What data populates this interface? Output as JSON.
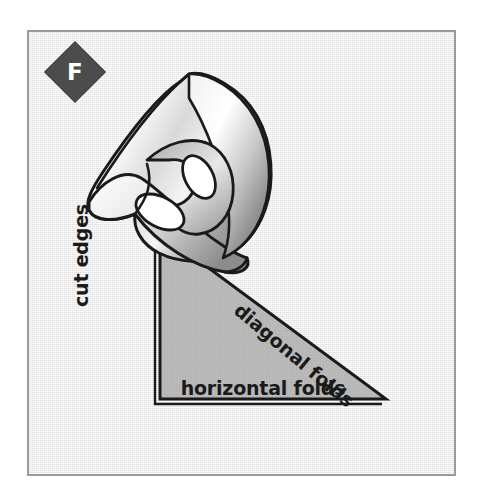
{
  "figure": {
    "panel_letter": "F",
    "panel_letter_name": "panel-label-f",
    "colors": {
      "frame_border": "#9a9a9e",
      "plate_background": "#eeeeee",
      "badge_fill": "#4c4c4c",
      "badge_text": "#ffffff",
      "ink": "#1a1a1a",
      "triangle_fill": "#b8b8b8",
      "paper_highlight": "#ffffff",
      "paper_shade": "#7d7d7d"
    },
    "labels": {
      "cut_edges": "cut edges",
      "diagonal_folds": "diagonal folds",
      "horizontal_folds": "horizontal folds"
    },
    "shapes": {
      "triangle": {
        "name": "folded-paper-triangle",
        "vertices": "130,205 130,368 357,368"
      },
      "cone": {
        "name": "curled-paper-cone",
        "openings": 2
      }
    }
  }
}
